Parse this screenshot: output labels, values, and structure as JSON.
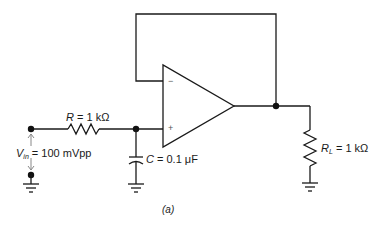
{
  "diagram": {
    "type": "circuit-schematic",
    "caption": "(a)",
    "components": {
      "input_source": {
        "symbol": "V",
        "subscript": "in",
        "value": "= 100 mVpp"
      },
      "resistor": {
        "symbol": "R",
        "value": "= 1 kΩ"
      },
      "capacitor": {
        "symbol": "C",
        "value": "= 0.1 μF"
      },
      "load_resistor": {
        "symbol": "R",
        "subscript": "L",
        "value": "= 1 kΩ"
      },
      "op_amp": {
        "inverting_label": "−",
        "noninverting_label": "+"
      }
    },
    "colors": {
      "wire": "#1a1a1a",
      "node": "#111111",
      "arrow": "#888888"
    }
  }
}
